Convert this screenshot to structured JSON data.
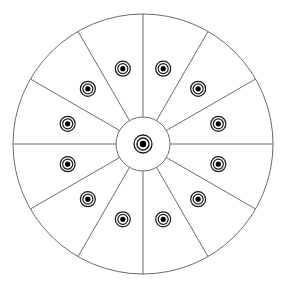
{
  "figure": {
    "name": "radial-sector-wheel-diagram",
    "caption_fragment": "",
    "colors": {
      "background": "#ffffff",
      "stroke": "#6b6b6b",
      "marker_ring": "#1a1a1a",
      "marker_core": "#000000",
      "fill": "#ffffff"
    },
    "geometry": {
      "center_x": 143,
      "center_y": 144,
      "outer_radius": 130,
      "hub_radius": 27,
      "marker_radius_from_center": 78,
      "sector_count": 12,
      "sector_angle_degrees": 30,
      "spoke_start_angle_degrees": 0,
      "marker_outer_r": 7.5,
      "marker_mid_r": 5,
      "marker_core_r": 2.6,
      "center_marker_outer_r": 9,
      "center_marker_mid_r": 6,
      "center_marker_core_r": 3.2,
      "stroke_width": 1
    }
  },
  "chart_data": {
    "type": "pie",
    "title": "",
    "subtitle": "",
    "xlabel": "",
    "ylabel": "",
    "legend_position": "none",
    "grid": false,
    "categories": [
      "sector-1",
      "sector-2",
      "sector-3",
      "sector-4",
      "sector-5",
      "sector-6",
      "sector-7",
      "sector-8",
      "sector-9",
      "sector-10",
      "sector-11",
      "sector-12"
    ],
    "values": [
      1,
      1,
      1,
      1,
      1,
      1,
      1,
      1,
      1,
      1,
      1,
      1
    ],
    "total_sectors": 12,
    "total_markers": 13,
    "sector_markers": 12,
    "center_markers": 1,
    "annotations": [
      {
        "label": "sector-1",
        "angle_start_deg": 0,
        "angle_end_deg": 30,
        "marker_angle_deg": 15,
        "marker_radius": 78
      },
      {
        "label": "sector-2",
        "angle_start_deg": 30,
        "angle_end_deg": 60,
        "marker_angle_deg": 45,
        "marker_radius": 78
      },
      {
        "label": "sector-3",
        "angle_start_deg": 60,
        "angle_end_deg": 90,
        "marker_angle_deg": 75,
        "marker_radius": 78
      },
      {
        "label": "sector-4",
        "angle_start_deg": 90,
        "angle_end_deg": 120,
        "marker_angle_deg": 105,
        "marker_radius": 78
      },
      {
        "label": "sector-5",
        "angle_start_deg": 120,
        "angle_end_deg": 150,
        "marker_angle_deg": 135,
        "marker_radius": 78
      },
      {
        "label": "sector-6",
        "angle_start_deg": 150,
        "angle_end_deg": 180,
        "marker_angle_deg": 165,
        "marker_radius": 78
      },
      {
        "label": "sector-7",
        "angle_start_deg": 180,
        "angle_end_deg": 210,
        "marker_angle_deg": 195,
        "marker_radius": 78
      },
      {
        "label": "sector-8",
        "angle_start_deg": 210,
        "angle_end_deg": 240,
        "marker_angle_deg": 225,
        "marker_radius": 78
      },
      {
        "label": "sector-9",
        "angle_start_deg": 240,
        "angle_end_deg": 270,
        "marker_angle_deg": 255,
        "marker_radius": 78
      },
      {
        "label": "sector-10",
        "angle_start_deg": 270,
        "angle_end_deg": 300,
        "marker_angle_deg": 285,
        "marker_radius": 78
      },
      {
        "label": "sector-11",
        "angle_start_deg": 300,
        "angle_end_deg": 330,
        "marker_angle_deg": 315,
        "marker_radius": 78
      },
      {
        "label": "sector-12",
        "angle_start_deg": 330,
        "angle_end_deg": 360,
        "marker_angle_deg": 345,
        "marker_radius": 78
      },
      {
        "label": "center",
        "angle_start_deg": 0,
        "angle_end_deg": 360,
        "marker_angle_deg": 0,
        "marker_radius": 0
      }
    ]
  }
}
